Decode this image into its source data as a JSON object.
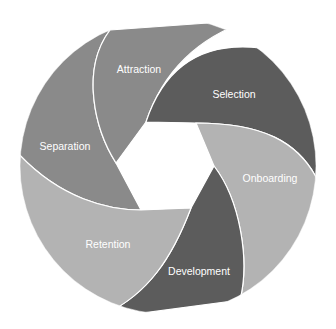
{
  "diagram": {
    "type": "cycle",
    "segments": [
      {
        "label": "Attraction",
        "color": "#8a8a8a"
      },
      {
        "label": "Selection",
        "color": "#5c5c5c"
      },
      {
        "label": "Onboarding",
        "color": "#b3b3b3"
      },
      {
        "label": "Development",
        "color": "#5c5c5c"
      },
      {
        "label": "Retention",
        "color": "#b3b3b3"
      },
      {
        "label": "Separation",
        "color": "#8a8a8a"
      }
    ]
  }
}
